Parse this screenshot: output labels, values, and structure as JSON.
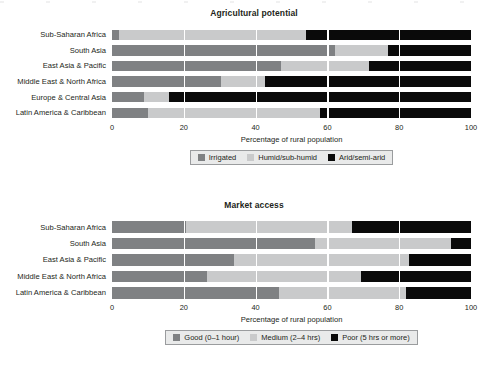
{
  "colors": {
    "series_1": "#7f8183",
    "series_2": "#c9cacb",
    "series_3": "#0a0a0a",
    "text": "#231f20",
    "legend_bg": "#e9eaea",
    "legend_border": "#9a9c9e",
    "gridline": "#ffffff"
  },
  "axis": {
    "title": "Percentage of rural population",
    "ticks": [
      "0",
      "20",
      "40",
      "60",
      "80",
      "100"
    ],
    "tick_values": [
      0,
      20,
      40,
      60,
      80,
      100
    ]
  },
  "panel_1": {
    "title": "Agricultural potential",
    "categories": [
      "Sub-Saharan Africa",
      "South Asia",
      "East Asia & Pacific",
      "Middle East & North Africa",
      "Europe & Central Asia",
      "Latin America & Caribbean"
    ],
    "legend": [
      {
        "label": "Irrigated",
        "swatch": "series_1"
      },
      {
        "label": "Humid/sub-humid",
        "swatch": "series_2"
      },
      {
        "label": "Arid/semi-arid",
        "swatch": "series_3"
      }
    ]
  },
  "panel_2": {
    "title": "Market access",
    "categories": [
      "Sub-Saharan Africa",
      "South Asia",
      "East Asia & Pacific",
      "Middle East & North Africa",
      "Latin America & Caribbean"
    ],
    "legend": [
      {
        "label": "Good (0–1 hour)",
        "swatch": "series_1"
      },
      {
        "label": "Medium (2–4 hrs)",
        "swatch": "series_2"
      },
      {
        "label": "Poor (5 hrs or more)",
        "swatch": "series_3"
      }
    ]
  },
  "chart_data": [
    {
      "type": "bar",
      "orientation": "horizontal",
      "stacked": true,
      "normalized": true,
      "title": "Agricultural potential",
      "xlabel": "Percentage of rural population",
      "ylabel": "",
      "xlim": [
        0,
        100
      ],
      "xticks": [
        0,
        20,
        40,
        60,
        80,
        100
      ],
      "grid": "vertical-white",
      "legend_position": "bottom-center",
      "categories": [
        "Sub-Saharan Africa",
        "South Asia",
        "East Asia & Pacific",
        "Middle East & North Africa",
        "Europe & Central Asia",
        "Latin America & Caribbean"
      ],
      "series": [
        {
          "name": "Irrigated",
          "color": "#7f8183",
          "values": [
            2,
            62,
            47,
            30.5,
            9,
            10
          ]
        },
        {
          "name": "Humid/sub-humid",
          "color": "#c9cacb",
          "values": [
            52,
            15,
            24.5,
            12,
            7,
            48
          ]
        },
        {
          "name": "Arid/semi-arid",
          "color": "#0a0a0a",
          "values": [
            46,
            23,
            28.5,
            57.5,
            84,
            42
          ]
        }
      ]
    },
    {
      "type": "bar",
      "orientation": "horizontal",
      "stacked": true,
      "normalized": true,
      "title": "Market access",
      "xlabel": "Percentage of rural population",
      "ylabel": "",
      "xlim": [
        0,
        100
      ],
      "xticks": [
        0,
        20,
        40,
        60,
        80,
        100
      ],
      "grid": "vertical-white",
      "legend_position": "bottom-center",
      "categories": [
        "Sub-Saharan Africa",
        "South Asia",
        "East Asia & Pacific",
        "Middle East & North Africa",
        "Latin America & Caribbean"
      ],
      "series": [
        {
          "name": "Good (0–1 hour)",
          "color": "#7f8183",
          "values": [
            20.5,
            56.5,
            34,
            26.5,
            46.5
          ]
        },
        {
          "name": "Medium (2–4 hrs)",
          "color": "#c9cacb",
          "values": [
            46.3,
            37.9,
            48.7,
            42.9,
            35.5
          ]
        },
        {
          "name": "Poor (5 hrs or more)",
          "color": "#0a0a0a",
          "values": [
            33.2,
            5.6,
            17.3,
            30.6,
            18
          ]
        }
      ]
    }
  ]
}
